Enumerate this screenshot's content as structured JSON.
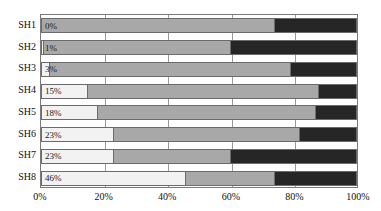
{
  "chart_data": {
    "type": "bar",
    "orientation": "horizontal",
    "stacked": true,
    "normalized": true,
    "title": "",
    "subtitle": "",
    "xlabel": "",
    "ylabel": "",
    "xlim": [
      0,
      100
    ],
    "grid": true,
    "legend": null,
    "legend_position": "none",
    "xticks": [
      "0%",
      "20%",
      "40%",
      "60%",
      "80%",
      "100%"
    ],
    "xtick_values": [
      0,
      20,
      40,
      60,
      80,
      100
    ],
    "categories": [
      "SH1",
      "SH2",
      "SH3",
      "SH4",
      "SH5",
      "SH6",
      "SH7",
      "SH8"
    ],
    "series": [
      {
        "name": "series-1",
        "color": "#f2f2f2",
        "values": [
          0,
          1,
          3,
          15,
          18,
          23,
          23,
          46
        ],
        "labels": [
          "0%",
          "1%",
          "3%",
          "15%",
          "18%",
          "23%",
          "23%",
          "46%"
        ],
        "labels_shown": true
      },
      {
        "name": "series-2",
        "color": "#a8a8a8",
        "values": [
          74,
          59,
          76,
          73,
          69,
          59,
          37,
          28
        ],
        "labels_shown": false
      },
      {
        "name": "series-3",
        "color": "#262626",
        "values": [
          26,
          40,
          21,
          12,
          13,
          18,
          40,
          26
        ],
        "labels_shown": false
      }
    ],
    "annotations": []
  },
  "axis": {
    "x_ticks": [
      "0%",
      "20%",
      "40%",
      "60%",
      "80%",
      "100%"
    ],
    "y_ticks": [
      "SH1",
      "SH2",
      "SH3",
      "SH4",
      "SH5",
      "SH6",
      "SH7",
      "SH8"
    ]
  },
  "colors": {
    "series_1": "#f2f2f2",
    "series_2": "#a8a8a8",
    "series_3": "#262626",
    "gridline": "#9a9a9a",
    "border": "#7a7a7a",
    "text": "#111111",
    "background": "#ffffff"
  }
}
